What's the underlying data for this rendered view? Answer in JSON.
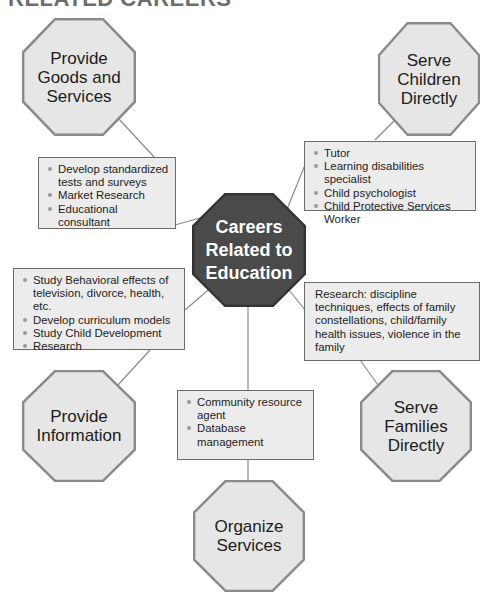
{
  "title": "RELATED CAREERS",
  "center": {
    "label_lines": [
      "Careers",
      "Related to",
      "Education"
    ],
    "fill_color": "#4a4a4a",
    "border_color": "#333333"
  },
  "octagon_style": {
    "fill_color": "#e6e6e6",
    "border_color": "#8a8a8a"
  },
  "branches": {
    "goods_services": {
      "label_lines": [
        "Provide",
        "Goods and",
        "Services"
      ],
      "items": [
        "Develop standardized tests and surveys",
        "Market Research",
        "Educational consultant"
      ]
    },
    "serve_children": {
      "label_lines": [
        "Serve",
        "Children",
        "Directly"
      ],
      "items": [
        "Tutor",
        "Learning disabilities specialist",
        "Child psychologist",
        "Child Protective Services Worker"
      ]
    },
    "provide_information": {
      "label_lines": [
        "Provide",
        "Information"
      ],
      "items": [
        "Study Behavioral effects of television, divorce, health, etc.",
        "Develop curriculum models",
        "Study Child Development",
        "Research"
      ]
    },
    "serve_families": {
      "label_lines": [
        "Serve",
        "Families",
        "Directly"
      ],
      "paragraph": "Research: discipline techniques, effects of family constellations, child/family health issues, violence in the family"
    },
    "organize_services": {
      "label_lines": [
        "Organize",
        "Services"
      ],
      "items": [
        "Community resource agent",
        "Database management"
      ]
    }
  }
}
